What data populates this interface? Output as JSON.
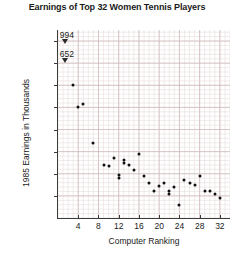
{
  "chart_data": {
    "type": "scatter",
    "title": "Earnings of Top 32 Women Tennis Players",
    "xlabel": "Computer Ranking",
    "ylabel": "1985 Earnings in Thousands",
    "xlim": [
      0,
      34
    ],
    "ylim": [
      0,
      425
    ],
    "grid": true,
    "legend": null,
    "x_ticks": [
      4,
      8,
      12,
      16,
      20,
      24,
      28,
      32
    ],
    "y_ticks": [
      50,
      100,
      150,
      200,
      250,
      300,
      350,
      400
    ],
    "offscale_annotations": [
      {
        "label": "994",
        "note": "rank 1 value above axis break"
      },
      {
        "label": "652",
        "note": "rank 2 value above axis break"
      }
    ],
    "x": [
      1,
      2,
      3,
      4,
      5,
      6,
      7,
      8,
      9,
      10,
      11,
      12,
      13,
      14,
      15,
      16,
      17,
      18,
      19,
      20,
      21,
      22,
      23,
      24,
      25,
      26,
      27,
      28,
      29,
      30,
      31,
      32
    ],
    "values": [
      994,
      652,
      300,
      250,
      258,
      170,
      120,
      118,
      135,
      98,
      90,
      103,
      105,
      100,
      85,
      145,
      92,
      78,
      60,
      70,
      55,
      72,
      62,
      52,
      30,
      80,
      72,
      62,
      95,
      60,
      58,
      45
    ],
    "series": [
      {
        "name": "1985 Earnings",
        "points": [
          {
            "rank": 1,
            "earnings": 994,
            "offscale": true
          },
          {
            "rank": 2,
            "earnings": 652,
            "offscale": true
          },
          {
            "rank": 3,
            "earnings": 300
          },
          {
            "rank": 4,
            "earnings": 250
          },
          {
            "rank": 5,
            "earnings": 258
          },
          {
            "rank": 7,
            "earnings": 170
          },
          {
            "rank": 9,
            "earnings": 120
          },
          {
            "rank": 10,
            "earnings": 118
          },
          {
            "rank": 11,
            "earnings": 135
          },
          {
            "rank": 12,
            "earnings": 98
          },
          {
            "rank": 12,
            "earnings": 90
          },
          {
            "rank": 13,
            "earnings": 130
          },
          {
            "rank": 13,
            "earnings": 125
          },
          {
            "rank": 14,
            "earnings": 120
          },
          {
            "rank": 15,
            "earnings": 108
          },
          {
            "rank": 16,
            "earnings": 145
          },
          {
            "rank": 17,
            "earnings": 95
          },
          {
            "rank": 18,
            "earnings": 78
          },
          {
            "rank": 19,
            "earnings": 60
          },
          {
            "rank": 20,
            "earnings": 72
          },
          {
            "rank": 21,
            "earnings": 80
          },
          {
            "rank": 22,
            "earnings": 62
          },
          {
            "rank": 22,
            "earnings": 55
          },
          {
            "rank": 23,
            "earnings": 70
          },
          {
            "rank": 24,
            "earnings": 30
          },
          {
            "rank": 25,
            "earnings": 85
          },
          {
            "rank": 26,
            "earnings": 80
          },
          {
            "rank": 27,
            "earnings": 75
          },
          {
            "rank": 28,
            "earnings": 95
          },
          {
            "rank": 29,
            "earnings": 62
          },
          {
            "rank": 30,
            "earnings": 60
          },
          {
            "rank": 31,
            "earnings": 55
          },
          {
            "rank": 32,
            "earnings": 45
          }
        ]
      }
    ]
  },
  "colors": {
    "point": "#111111",
    "axis": "#3a3a3a",
    "grid_minor": "#e8dede",
    "grid_major": "#cfbcbc",
    "background": "#ffffff",
    "text": "#1a1a1a"
  }
}
